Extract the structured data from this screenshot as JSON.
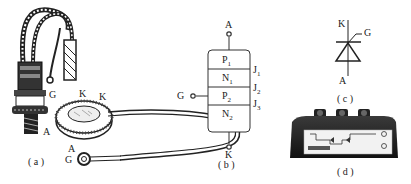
{
  "figure": {
    "panel_a": {
      "caption": "( a )",
      "stud_thyristor": {
        "gate": "G",
        "cathode": "K",
        "anode": "A"
      },
      "disc_thyristor": {
        "cathode": "K",
        "anode": "A",
        "gate": "G"
      }
    },
    "panel_b": {
      "caption": "( b )",
      "terminals": {
        "anode": "A",
        "gate": "G",
        "cathode": "K"
      },
      "layers": [
        {
          "name": "P",
          "sub": "1"
        },
        {
          "name": "N",
          "sub": "1"
        },
        {
          "name": "P",
          "sub": "2"
        },
        {
          "name": "N",
          "sub": "2"
        }
      ],
      "junctions": [
        {
          "name": "J",
          "sub": "1"
        },
        {
          "name": "J",
          "sub": "2"
        },
        {
          "name": "J",
          "sub": "3"
        }
      ]
    },
    "panel_c": {
      "caption": "( c )",
      "symbol": "thyristor-symbol",
      "terminals": {
        "cathode": "K",
        "gate": "G",
        "anode": "A"
      }
    },
    "panel_d": {
      "caption": "( d )",
      "object": "thyristor-module-photo"
    }
  }
}
